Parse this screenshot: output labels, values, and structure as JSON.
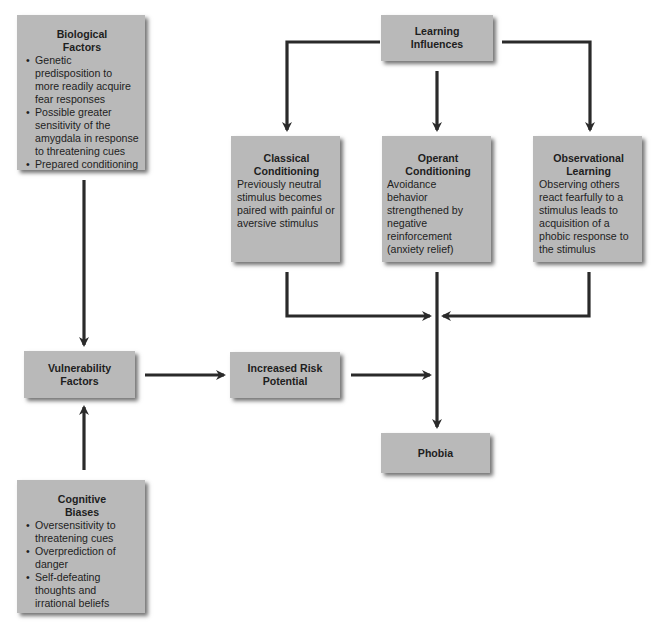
{
  "diagram": {
    "biological": {
      "title_line1": "Biological",
      "title_line2": "Factors",
      "bullets": [
        "Genetic predisposition to more readily acquire fear responses",
        "Possible greater sensitivity of the amygdala in response to threatening cues",
        "Prepared conditioning"
      ]
    },
    "learning": {
      "title_line1": "Learning",
      "title_line2": "Influences"
    },
    "classical": {
      "title_line1": "Classical",
      "title_line2": "Conditioning",
      "description": "Previously neutral stimulus becomes paired with painful or aversive stimulus"
    },
    "operant": {
      "title_line1": "Operant",
      "title_line2": "Conditioning",
      "description": "Avoidance behavior strengthened by negative reinforcement (anxiety relief)"
    },
    "observational": {
      "title_line1": "Observational",
      "title_line2": "Learning",
      "description": "Observing others react fearfully to a stimulus leads to acquisition of a phobic response to the stimulus"
    },
    "vulnerability": {
      "title_line1": "Vulnerability",
      "title_line2": "Factors"
    },
    "risk": {
      "title_line1": "Increased Risk",
      "title_line2": "Potential"
    },
    "phobia": {
      "title": "Phobia"
    },
    "cognitive": {
      "title_line1": "Cognitive",
      "title_line2": "Biases",
      "bullets": [
        "Oversensitivity to threatening cues",
        "Overprediction of danger",
        "Self-defeating thoughts and irrational beliefs"
      ]
    },
    "colors": {
      "box_fill": "#b9b9b9",
      "arrow": "#2a2a2a",
      "background": "#ffffff"
    }
  }
}
